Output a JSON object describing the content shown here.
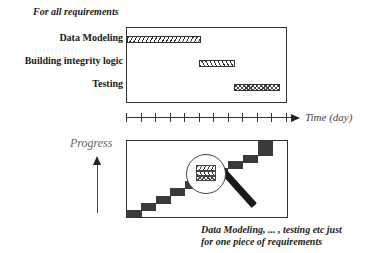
{
  "gantt": {
    "header": "For all requirements",
    "tasks": [
      {
        "label": "Data Modeling",
        "pattern": "forward-hatch"
      },
      {
        "label": "Building integrity logic",
        "pattern": "back-hatch"
      },
      {
        "label": "Testing",
        "pattern": "cross-hatch"
      }
    ],
    "time_axis": {
      "label": "Time (day)",
      "tick_count": 12
    }
  },
  "progress": {
    "y_label": "Progress",
    "steps": 11,
    "magnifier_note_line1": "Data Modeling, ... , testing etc  just",
    "magnifier_note_line2": "for one piece of requirements"
  },
  "colors": {
    "stroke": "#333333",
    "block": "#3a3a3a",
    "background": "#ffffff"
  }
}
